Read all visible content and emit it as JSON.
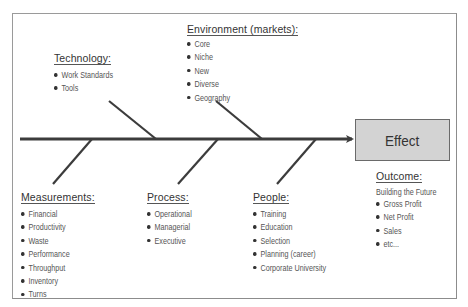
{
  "diagram": {
    "type": "fishbone",
    "effect": {
      "label": "Effect",
      "fill": "#d3d3d3"
    },
    "causes": {
      "technology": {
        "title": "Technology:",
        "items": [
          "Work Standards",
          "Tools"
        ]
      },
      "environment": {
        "title": "Environment (markets):",
        "items": [
          "Core",
          "Niche",
          "New",
          "Diverse",
          "Geography"
        ]
      },
      "measurements": {
        "title": "Measurements:",
        "items": [
          "Financial",
          "Productivity",
          "Waste",
          "Performance",
          "Throughput",
          "Inventory",
          "Turns"
        ]
      },
      "process": {
        "title": "Process:",
        "items": [
          "Operational",
          "Managerial",
          "Executive"
        ]
      },
      "people": {
        "title": "People:",
        "items": [
          "Training",
          "Education",
          "Selection",
          "Planning (career)",
          "Corporate University"
        ]
      }
    },
    "outcome": {
      "title": "Outcome:",
      "subtitle": "Building the Future",
      "items": [
        "Gross Profit",
        "Net Profit",
        "Sales",
        "etc..."
      ]
    },
    "colors": {
      "line": "#3c3c3c",
      "frame": "#9a9a9a",
      "text": "#555555"
    }
  }
}
